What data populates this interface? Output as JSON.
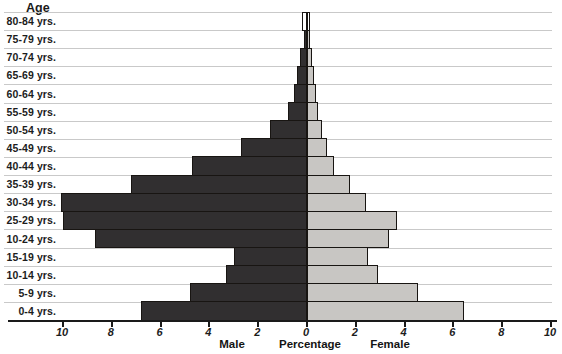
{
  "title": "Age",
  "footer_labels": {
    "male": "Male",
    "percentage": "Percentage",
    "female": "Female"
  },
  "colors": {
    "male_fill": "#312f30",
    "female_fill": "#c8c6c3",
    "top_row_fill": "#ffffff",
    "bar_border": "#181512",
    "gridline": "#c9c9c9",
    "axis": "#1a1a1a",
    "text": "#1c1c1c",
    "background": "#ffffff"
  },
  "chart_data": {
    "type": "bar",
    "subtype": "population_pyramid",
    "title": "Age",
    "xlabel": "Percentage",
    "left_side_label": "Male",
    "right_side_label": "Female",
    "categories_top_to_bottom": [
      "80-84 yrs.",
      "75-79 yrs.",
      "70-74 yrs.",
      "65-69 yrs.",
      "60-64 yrs.",
      "55-59 yrs.",
      "50-54 yrs.",
      "45-49 yrs.",
      "40-44 yrs.",
      "35-39 yrs.",
      "30-34 yrs.",
      "25-29 yrs.",
      "10-24 yrs.",
      "15-19 yrs.",
      "10-14 yrs.",
      "5-9 yrs.",
      "0-4 yrs."
    ],
    "series": [
      {
        "name": "Male",
        "side": "left",
        "values": [
          0.2,
          0.12,
          0.27,
          0.4,
          0.55,
          0.78,
          1.5,
          2.7,
          4.7,
          7.2,
          10.1,
          10.0,
          8.7,
          3.0,
          3.3,
          4.8,
          6.8
        ]
      },
      {
        "name": "Female",
        "side": "right",
        "values": [
          0.1,
          0.14,
          0.22,
          0.3,
          0.37,
          0.45,
          0.63,
          0.8,
          1.1,
          1.75,
          2.4,
          3.7,
          3.35,
          2.5,
          2.9,
          4.55,
          6.45
        ]
      }
    ],
    "x_tick_labels": [
      10,
      8,
      6,
      4,
      2,
      0,
      2,
      4,
      6,
      8,
      10
    ],
    "x_tick_step": 2,
    "xlim_each_side": [
      0,
      10
    ],
    "grid": "horizontal",
    "legend": "none"
  }
}
